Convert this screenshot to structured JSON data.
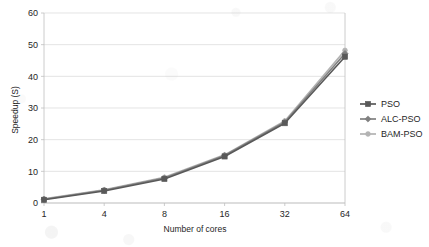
{
  "chart_data": {
    "type": "line",
    "title": "",
    "xlabel": "Number of cores",
    "ylabel": "Speedup (S)",
    "categories": [
      "1",
      "4",
      "8",
      "16",
      "32",
      "64"
    ],
    "ylim": [
      0,
      60
    ],
    "yticks": [
      "0",
      "10",
      "20",
      "30",
      "40",
      "50",
      "60"
    ],
    "grid": true,
    "legend_position": "right",
    "series": [
      {
        "name": "PSO",
        "color": "#595959",
        "marker": "square",
        "values": [
          1.0,
          3.8,
          7.6,
          14.7,
          25.2,
          46.2
        ]
      },
      {
        "name": "ALC-PSO",
        "color": "#808080",
        "marker": "diamond",
        "values": [
          1.2,
          4.0,
          7.9,
          15.0,
          25.6,
          47.2
        ]
      },
      {
        "name": "BAM-PSO",
        "color": "#b3b3b3",
        "marker": "circle",
        "values": [
          1.3,
          4.2,
          8.1,
          15.2,
          25.9,
          48.2
        ]
      }
    ]
  },
  "legend": {
    "items": [
      {
        "label": "PSO"
      },
      {
        "label": "ALC-PSO"
      },
      {
        "label": "BAM-PSO"
      }
    ]
  },
  "colors": {
    "series_1": "#595959",
    "series_2": "#808080",
    "series_3": "#b3b3b3",
    "grid": "#d9d9d9",
    "axis": "#bfbfbf",
    "text": "#262626",
    "background": "#ffffff"
  }
}
